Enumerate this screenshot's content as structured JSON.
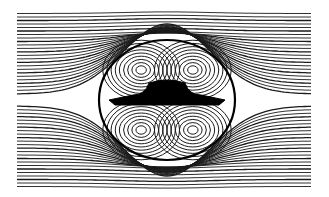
{
  "figure": {
    "type": "streamline-flow-visualization",
    "background": "#ffffff",
    "line_color": "#1a1a1a",
    "body_color": "#000000",
    "frame": {
      "x0": 17,
      "x1": 312,
      "y0": 12,
      "y1": 182
    },
    "body": {
      "cx": 167,
      "cy": 100,
      "wing_half_width": 58,
      "wing_thickness": 10,
      "dome_half_width": 22,
      "dome_height": 16
    },
    "recirculation_region": {
      "cx": 167,
      "cy": 100,
      "rx": 68,
      "ry": 60
    },
    "streamline_count_per_side": 24,
    "vortex_rings_per_quadrant": 9
  }
}
